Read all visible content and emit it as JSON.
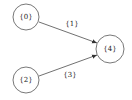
{
  "diagram": {
    "nodes": [
      {
        "id": "n0",
        "label": "{0}",
        "cx": 26,
        "cy": 17,
        "r": 13
      },
      {
        "id": "n2",
        "label": "{2}",
        "cx": 26,
        "cy": 80,
        "r": 13
      },
      {
        "id": "n4",
        "label": "{4}",
        "cx": 110,
        "cy": 49,
        "r": 14
      }
    ],
    "edges": [
      {
        "from": "{0}",
        "to": "{4}",
        "label": "{1}",
        "x1": 39,
        "y1": 22,
        "x2": 97,
        "y2": 43,
        "lx": 72,
        "ly": 24
      },
      {
        "from": "{2}",
        "to": "{4}",
        "label": "{3}",
        "x1": 39,
        "y1": 76,
        "x2": 97,
        "y2": 55,
        "lx": 70,
        "ly": 75
      }
    ],
    "colors": {
      "stroke": "#555555",
      "text": "#222222",
      "background": "#ffffff"
    }
  }
}
